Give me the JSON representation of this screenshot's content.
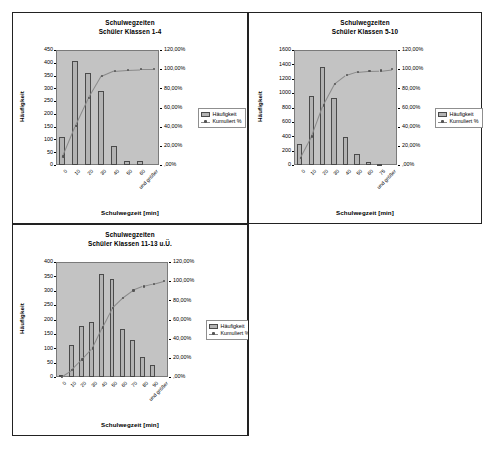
{
  "document": {
    "background": "#ffffff",
    "frame_color": "#222222",
    "plot_background": "#c3c3c3",
    "bar_color": "#b3b3b3",
    "line_color": "#8a8a8a"
  },
  "legend": {
    "bar_label": "Häufigkeit",
    "line_label": "Kumuliert %",
    "bar_icon": "bar-swatch-icon",
    "line_icon": "line-marker-swatch-icon"
  },
  "axis": {
    "x_title": "Schulwegzeit [min]",
    "y_title": "Häufigkeit"
  },
  "charts": [
    {
      "id": "chart-klassen-1-4",
      "title_line1": "Schulwegzeiten",
      "title_line2": "Schüler Klassen 1-4",
      "chart_data": {
        "type": "bar",
        "title": "Schulwegzeiten / Schüler Klassen 1-4",
        "xlabel": "Schulwegzeit [min]",
        "ylabel": "Häufigkeit",
        "y2label": "Kumuliert %",
        "grid": false,
        "legend_position": "right",
        "categories": [
          "0",
          "10",
          "20",
          "30",
          "40",
          "50",
          "60",
          "und größer"
        ],
        "series": [
          {
            "name": "Häufigkeit",
            "type": "bar",
            "values": [
              108,
              408,
              360,
              290,
              73,
              14,
              14,
              0
            ]
          },
          {
            "name": "Kumuliert %",
            "type": "line",
            "values": [
              8.8,
              41.0,
              69.5,
              92.5,
              98.3,
              99.4,
              100.0,
              100.0
            ]
          }
        ],
        "yticks": [
          0,
          50,
          100,
          150,
          200,
          250,
          300,
          350,
          400,
          450
        ],
        "ytick_labels": [
          "0",
          "50",
          "100",
          "150",
          "200",
          "250",
          "300",
          "350",
          "400",
          "450"
        ],
        "ylim": [
          0,
          450
        ],
        "y2ticks": [
          0,
          20,
          40,
          60,
          80,
          100,
          120
        ],
        "y2tick_labels": [
          ",00%",
          "20,00%",
          "40,00%",
          "60,00%",
          "80,00%",
          "100,00%",
          "120,00%"
        ],
        "y2lim": [
          0,
          120
        ]
      }
    },
    {
      "id": "chart-klassen-5-10",
      "title_line1": "Schulwegzeiten",
      "title_line2": "Schüler Klassen 5-10",
      "chart_data": {
        "type": "bar",
        "title": "Schulwegzeiten / Schüler Klassen 5-10",
        "xlabel": "Schulwegzeit [min]",
        "ylabel": "Häufigkeit",
        "y2label": "Kumuliert %",
        "grid": false,
        "legend_position": "right",
        "categories": [
          "0",
          "10",
          "20",
          "30",
          "40",
          "50",
          "60",
          "75",
          "und größer"
        ],
        "series": [
          {
            "name": "Häufigkeit",
            "type": "bar",
            "values": [
              290,
              960,
              1365,
              935,
              385,
              160,
              45,
              10,
              0
            ]
          },
          {
            "name": "Kumuliert %",
            "type": "line",
            "values": [
              6.9,
              29.7,
              62.1,
              84.3,
              93.5,
              97.3,
              98.4,
              98.6,
              100.0
            ]
          }
        ],
        "yticks": [
          0,
          200,
          400,
          600,
          800,
          1000,
          1200,
          1400,
          1600
        ],
        "ytick_labels": [
          "0",
          "200",
          "400",
          "600",
          "800",
          "1000",
          "1200",
          "1400",
          "1600"
        ],
        "ylim": [
          0,
          1600
        ],
        "y2ticks": [
          0,
          20,
          40,
          60,
          80,
          100,
          120
        ],
        "y2tick_labels": [
          ",00%",
          "20,00%",
          "40,00%",
          "60,00%",
          "80,00%",
          "100,00%",
          "120,00%"
        ],
        "y2lim": [
          0,
          120
        ]
      }
    },
    {
      "id": "chart-klassen-11-13",
      "title_line1": "Schulwegzeiten",
      "title_line2": "Schüler Klassen 11-13 u.Ü.",
      "chart_data": {
        "type": "bar",
        "title": "Schulwegzeiten / Schüler Klassen 11-13 u.Ü.",
        "xlabel": "Schulwegzeit [min]",
        "ylabel": "Häufigkeit",
        "y2label": "Kumuliert %",
        "grid": false,
        "legend_position": "right",
        "categories": [
          "0",
          "10",
          "20",
          "30",
          "40",
          "50",
          "60",
          "70",
          "80",
          "90",
          "und größer"
        ],
        "series": [
          {
            "name": "Häufigkeit",
            "type": "bar",
            "values": [
              6,
              113,
              178,
              190,
              357,
              340,
              168,
              127,
              68,
              43,
              0
            ]
          },
          {
            "name": "Kumuliert %",
            "type": "line",
            "values": [
              0.4,
              7.3,
              18.2,
              29.8,
              51.6,
              72.3,
              82.6,
              90.3,
              94.5,
              97.1,
              100.0
            ]
          }
        ],
        "yticks": [
          0,
          50,
          100,
          150,
          200,
          250,
          300,
          350,
          400
        ],
        "ytick_labels": [
          "0",
          "50",
          "100",
          "150",
          "200",
          "250",
          "300",
          "350",
          "400"
        ],
        "ylim": [
          0,
          400
        ],
        "y2ticks": [
          0,
          20,
          40,
          60,
          80,
          100,
          120
        ],
        "y2tick_labels": [
          ",00%",
          "20,00%",
          "40,00%",
          "60,00%",
          "80,00%",
          "100,00%",
          "120,00%"
        ],
        "y2lim": [
          0,
          120
        ]
      }
    }
  ]
}
